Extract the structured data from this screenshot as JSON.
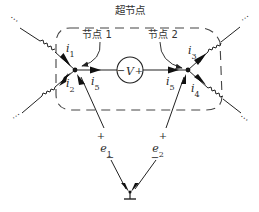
{
  "diagram": {
    "type": "circuit",
    "title": "超节点",
    "nodes": [
      {
        "id": "node1",
        "label": "节点 1"
      },
      {
        "id": "node2",
        "label": "节点 2"
      }
    ],
    "voltage_source": {
      "label": "V",
      "minus": "−",
      "plus": "+"
    },
    "currents": {
      "i1": "i1",
      "i2": "i2",
      "i3": "i3",
      "i4": "i4",
      "i5_left": "i5",
      "i5_right": "i5"
    },
    "sources": [
      {
        "name": "e1",
        "plus": "+",
        "minus": "−"
      },
      {
        "name": "e2",
        "plus": "+",
        "minus": "−"
      }
    ],
    "ellipsis": "⋯",
    "colors": {
      "stroke": "#2a2a2a",
      "background": "#ffffff"
    }
  }
}
